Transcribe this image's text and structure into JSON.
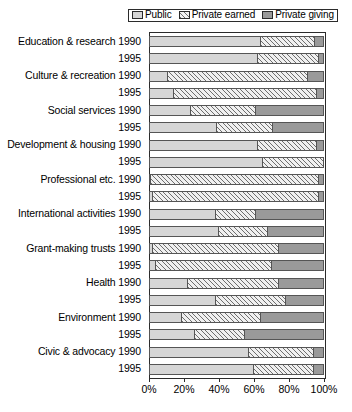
{
  "chart_data": {
    "type": "bar",
    "orientation": "horizontal",
    "stacked": true,
    "normalized_percent": true,
    "title": "",
    "subtitle": "",
    "xlabel": "",
    "ylabel": "",
    "xlim": [
      0,
      100
    ],
    "xticks": [
      0,
      20,
      40,
      60,
      80,
      100
    ],
    "xticklabels": [
      "0%",
      "20%",
      "40%",
      "60%",
      "80%",
      "100%"
    ],
    "grid": false,
    "legend_position": "top-right",
    "legend": [
      "Public",
      "Private earned",
      "Private giving"
    ],
    "series": [
      {
        "name": "Public",
        "swatch_name": "public-swatch",
        "fill": "light-grey-solid",
        "color": "#d6d6d6",
        "values": [
          64,
          62,
          11,
          14,
          24,
          39,
          62,
          65,
          1,
          2,
          38,
          40,
          2,
          4,
          22,
          38,
          19,
          26,
          57,
          60
        ]
      },
      {
        "name": "Private earned",
        "swatch_name": "private-earned-swatch",
        "fill": "diagonal-hatch",
        "color": "#f0f0f0",
        "values": [
          31,
          35,
          80,
          82,
          37,
          32,
          34,
          35,
          96,
          95,
          23,
          28,
          72,
          66,
          52,
          40,
          45,
          29,
          37,
          34
        ]
      },
      {
        "name": "Private giving",
        "swatch_name": "private-giving-swatch",
        "fill": "dark-grey-solid",
        "color": "#9a9a9a",
        "values": [
          5,
          3,
          9,
          4,
          39,
          29,
          4,
          0,
          3,
          3,
          39,
          32,
          26,
          30,
          26,
          22,
          36,
          45,
          6,
          6
        ]
      }
    ],
    "categories": [
      "Education & research 1990",
      "Education & research 1995",
      "Culture & recreation 1990",
      "Culture & recreation 1995",
      "Social services 1990",
      "Social services 1995",
      "Development & housing 1990",
      "Development & housing 1995",
      "Professional etc. 1990",
      "Professional etc. 1995",
      "International activities 1990",
      "International activities 1995",
      "Grant-making trusts 1990",
      "Grant-making trusts 1995",
      "Health 1990",
      "Health 1995",
      "Environment 1990",
      "Environment 1995",
      "Civic & advocacy 1990",
      "Civic & advocacy 1995"
    ],
    "category_labels": [
      "Education & research 1990",
      "1995",
      "Culture & recreation 1990",
      "1995",
      "Social services 1990",
      "1995",
      "Development & housing 1990",
      "1995",
      "Professional etc. 1990",
      "1995",
      "International activities 1990",
      "1995",
      "Grant-making trusts 1990",
      "1995",
      "Health 1990",
      "1995",
      "Environment 1990",
      "1995",
      "Civic & advocacy 1990",
      "1995"
    ]
  }
}
